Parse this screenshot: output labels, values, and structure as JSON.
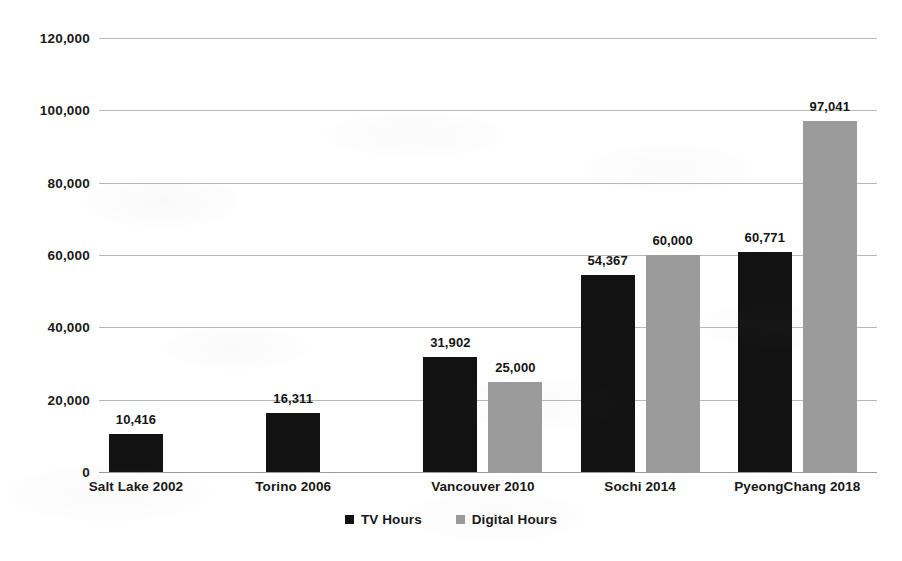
{
  "chart_data": {
    "type": "bar",
    "title": "",
    "subtitle": "",
    "xlabel": "",
    "ylabel": "",
    "categories": [
      "Salt Lake 2002",
      "Torino 2006",
      "Vancouver 2010",
      "Sochi 2014",
      "PyeongChang 2018"
    ],
    "series": [
      {
        "name": "TV Hours",
        "color": "#121212",
        "values": [
          10416,
          16311,
          31902,
          54367,
          60771
        ],
        "labels": [
          "10,416",
          "16,311",
          "31,902",
          "54,367",
          "60,771"
        ]
      },
      {
        "name": "Digital Hours",
        "color": "#9b9b9b",
        "values": [
          null,
          null,
          25000,
          60000,
          97041
        ],
        "labels": [
          "",
          "",
          "25,000",
          "60,000",
          "97,041"
        ]
      }
    ],
    "ylim": [
      0,
      120000
    ],
    "yticks": [
      0,
      20000,
      40000,
      60000,
      80000,
      100000,
      120000
    ],
    "ytick_labels": [
      "0",
      "20,000",
      "40,000",
      "60,000",
      "80,000",
      "100,000",
      "120,000"
    ],
    "grid": true,
    "legend_position": "bottom"
  },
  "legend": {
    "items": [
      {
        "label": "TV Hours",
        "swatch": "tv"
      },
      {
        "label": "Digital Hours",
        "swatch": "digital"
      }
    ]
  }
}
